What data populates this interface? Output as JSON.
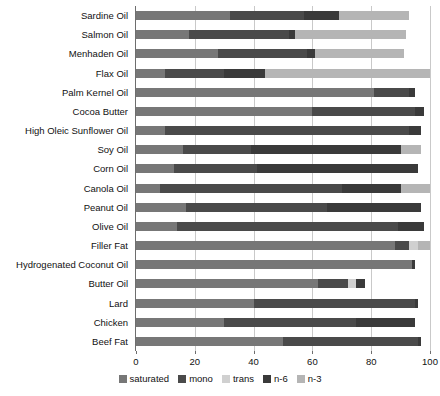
{
  "chart_data": {
    "type": "bar",
    "orientation": "horizontal",
    "stacked": true,
    "title": "",
    "xlabel": "",
    "ylabel": "",
    "xlim": [
      0,
      100
    ],
    "xticks": [
      0,
      20,
      40,
      60,
      80,
      100
    ],
    "xtick_labels": [
      "0",
      "20",
      "40",
      "60",
      "80",
      "100"
    ],
    "grid": true,
    "grid_axis": "x",
    "legend_position": "bottom",
    "categories": [
      "Sardine Oil",
      "Salmon Oil",
      "Menhaden Oil",
      "Flax Oil",
      "Palm Kernel Oil",
      "Cocoa Butter",
      "High Oleic Sunflower Oil",
      "Soy Oil",
      "Corn Oil",
      "Canola Oil",
      "Peanut Oil",
      "Olive Oil",
      "Filler Fat",
      "Hydrogenated Coconut Oil",
      "Butter Oil",
      "Lard",
      "Chicken",
      "Beef Fat"
    ],
    "series": [
      {
        "name": "saturated",
        "color": "#777777",
        "values": [
          32,
          18,
          28,
          10,
          81,
          60,
          10,
          16,
          13,
          8,
          17,
          14,
          88,
          94,
          62,
          40,
          30,
          50
        ]
      },
      {
        "name": "mono",
        "color": "#4a4a4a",
        "values": [
          25,
          34,
          30,
          20,
          12,
          35,
          83,
          23,
          28,
          62,
          48,
          75,
          5,
          0,
          10,
          55,
          45,
          46
        ]
      },
      {
        "name": "trans",
        "color": "#d0d0d0",
        "values": [
          0,
          0,
          0,
          0,
          0,
          0,
          0,
          0,
          0,
          0,
          0,
          0,
          3,
          0,
          3,
          0,
          0,
          0
        ]
      },
      {
        "name": "n-6",
        "color": "#3a3a3a",
        "values": [
          12,
          2,
          3,
          14,
          2,
          3,
          4,
          51,
          55,
          20,
          32,
          9,
          0,
          1,
          3,
          1,
          20,
          1
        ]
      },
      {
        "name": "n-3",
        "color": "#b5b5b5",
        "values": [
          24,
          38,
          30,
          56,
          0,
          0,
          0,
          7,
          0,
          10,
          0,
          0,
          4,
          0,
          0,
          0,
          0,
          0
        ]
      }
    ]
  },
  "legend": {
    "items": [
      {
        "label": "saturated",
        "color": "#777777"
      },
      {
        "label": "mono",
        "color": "#4a4a4a"
      },
      {
        "label": "trans",
        "color": "#d0d0d0"
      },
      {
        "label": "n-6",
        "color": "#3a3a3a"
      },
      {
        "label": "n-3",
        "color": "#b5b5b5"
      }
    ]
  }
}
